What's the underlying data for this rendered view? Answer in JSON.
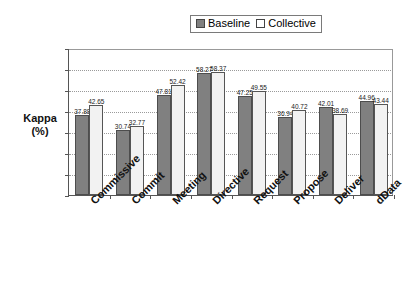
{
  "chart_data": {
    "type": "bar",
    "title": "",
    "xlabel": "",
    "ylabel": "Kappa (%)",
    "ylim": [
      0,
      70
    ],
    "yticks": [
      0,
      10,
      20,
      30,
      40,
      50,
      60,
      70
    ],
    "grid": true,
    "legend_position": "top",
    "categories": [
      "Commissive",
      "Commit",
      "Meeting",
      "Directive",
      "Request",
      "Propose",
      "Deliver",
      "dData"
    ],
    "series": [
      {
        "name": "Baseline",
        "color": "#808080",
        "values": [
          37.88,
          30.74,
          47.81,
          58.27,
          47.25,
          36.94,
          42.01,
          44.96
        ],
        "labels": [
          "37.88",
          "30.74",
          "47.81",
          "58.27",
          "47.25",
          "36.94",
          "42.01",
          "44.96"
        ]
      },
      {
        "name": "Collective",
        "color": "#ffffff",
        "values": [
          42.65,
          32.77,
          52.42,
          58.37,
          49.55,
          40.72,
          38.69,
          43.44
        ],
        "labels": [
          "42.65",
          "32.77",
          "52.42",
          "58.37",
          "49.55",
          "40.72",
          "38.69",
          "43.44"
        ]
      }
    ]
  },
  "legend": {
    "items": [
      {
        "label": "Baseline",
        "swatch": "filled-gray-square-icon"
      },
      {
        "label": "Collective",
        "swatch": "outline-white-square-icon"
      }
    ]
  },
  "axis": {
    "y_title_line1": "Kappa",
    "y_title_line2": "(%)"
  }
}
